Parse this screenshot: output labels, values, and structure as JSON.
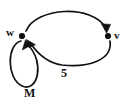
{
  "diagram": {
    "type": "directed-graph",
    "title": "",
    "background_color": "#ffffff",
    "stroke_color": "#111111",
    "nodes": [
      {
        "id": "w",
        "label": "w",
        "x": 22,
        "y": 36
      },
      {
        "id": "v",
        "label": "v",
        "x": 108,
        "y": 36
      }
    ],
    "edges": [
      {
        "id": "w-to-v",
        "from": "w",
        "to": "v",
        "label": "",
        "direction": "w to v",
        "shape": "upper-arc"
      },
      {
        "id": "v-to-w",
        "from": "v",
        "to": "w",
        "label": "5",
        "direction": "v to w",
        "shape": "lower-arc"
      },
      {
        "id": "w-self-loop",
        "from": "w",
        "to": "w",
        "label": "M",
        "direction": "w to w",
        "shape": "self-loop"
      }
    ],
    "labels": {
      "node_w": "w",
      "node_v": "v",
      "edge_weight": "5",
      "loop_name": "M"
    }
  }
}
